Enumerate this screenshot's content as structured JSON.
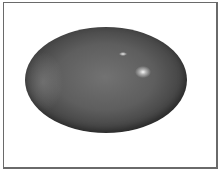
{
  "image": {
    "subject": "oval gray polished stone cabochon on white background",
    "frame": {
      "border_color": "#6a6a6a",
      "background": "#ffffff"
    },
    "stone": {
      "base_color": "#5e5e5e",
      "highlight_color": "#ffffff"
    }
  }
}
